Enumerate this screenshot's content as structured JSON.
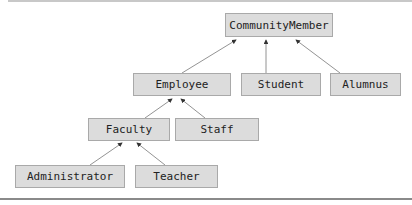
{
  "diagram": {
    "type": "uml-inheritance-hierarchy",
    "nodes": {
      "community_member": "CommunityMember",
      "employee": "Employee",
      "student": "Student",
      "alumnus": "Alumnus",
      "faculty": "Faculty",
      "staff": "Staff",
      "administrator": "Administrator",
      "teacher": "Teacher"
    },
    "edges": [
      {
        "from": "Employee",
        "to": "CommunityMember"
      },
      {
        "from": "Student",
        "to": "CommunityMember"
      },
      {
        "from": "Alumnus",
        "to": "CommunityMember"
      },
      {
        "from": "Faculty",
        "to": "Employee"
      },
      {
        "from": "Staff",
        "to": "Employee"
      },
      {
        "from": "Administrator",
        "to": "Faculty"
      },
      {
        "from": "Teacher",
        "to": "Faculty"
      }
    ],
    "colors": {
      "box_fill": "#dcdcdc",
      "box_border": "#a9a9a9",
      "arrow": "#555555"
    }
  }
}
